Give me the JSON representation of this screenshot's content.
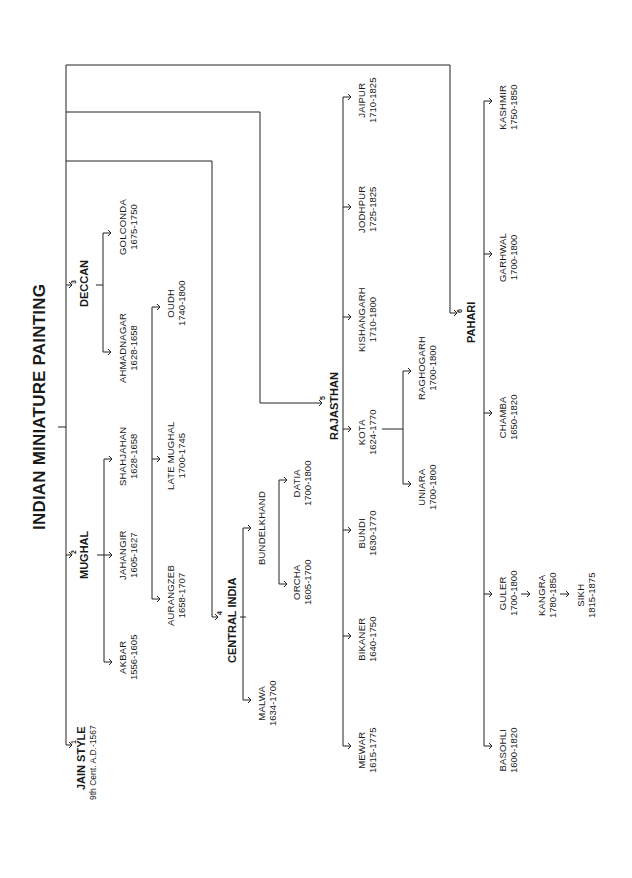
{
  "title": "INDIAN MINIATURE PAINTING",
  "orientation": "rotated 90deg counter-clockwise",
  "schools": [
    {
      "number": "1",
      "name": "JAIN STYLE",
      "dates": "9th Cent. A.D.-1567",
      "children": []
    },
    {
      "number": "2",
      "name": "MUGHAL",
      "children": [
        {
          "name": "AKBAR",
          "dates": "1556-1605"
        },
        {
          "name": "JAHANGIR",
          "dates": "1605-1627"
        },
        {
          "name": "SHAHJAHAN",
          "dates": "1628-1658"
        },
        {
          "name": "AURANGZEB",
          "dates": "1658-1707"
        },
        {
          "name": "LATE MUGHAL",
          "dates": "1700-1745"
        },
        {
          "name": "OUDH",
          "dates": "1740-1800"
        }
      ]
    },
    {
      "number": "3",
      "name": "DECCAN",
      "children": [
        {
          "name": "AHMADNAGAR",
          "dates": "1628-1658"
        },
        {
          "name": "GOLCONDA",
          "dates": "1675-1750"
        }
      ]
    },
    {
      "number": "4",
      "name": "CENTRAL INDIA",
      "children": [
        {
          "name": "MALWA",
          "dates": "1634-1700"
        },
        {
          "name": "BUNDELKHAND",
          "dates": "",
          "children": [
            {
              "name": "ORCHA",
              "dates": "1605-1700"
            },
            {
              "name": "DATIA",
              "dates": "1700-1800"
            }
          ]
        }
      ]
    },
    {
      "number": "5",
      "name": "RAJASTHAN",
      "children": [
        {
          "name": "MEWAR",
          "dates": "1615-1775"
        },
        {
          "name": "BIKANER",
          "dates": "1640-1750"
        },
        {
          "name": "BUNDI",
          "dates": "1630-1770"
        },
        {
          "name": "KOTA",
          "dates": "1624-1770",
          "children": [
            {
              "name": "UNIARA",
              "dates": "1700-1800"
            },
            {
              "name": "RAGHOGARH",
              "dates": "1700-1800"
            }
          ]
        },
        {
          "name": "KISHANGARH",
          "dates": "1710-1800"
        },
        {
          "name": "JODHPUR",
          "dates": "1725-1825"
        },
        {
          "name": "JAIPUR",
          "dates": "1710-1825"
        }
      ]
    },
    {
      "number": "6",
      "name": "PAHARI",
      "children": [
        {
          "name": "BASOHLI",
          "dates": "1600-1820"
        },
        {
          "name": "GULER",
          "dates": "1700-1800",
          "children": [
            {
              "name": "KANGRA",
              "dates": "1780-1850",
              "children": [
                {
                  "name": "SIKH",
                  "dates": "1815-1875"
                }
              ]
            }
          ]
        },
        {
          "name": "CHAMBA",
          "dates": "1650-1820"
        },
        {
          "name": "GARHWAL",
          "dates": "1700-1800"
        },
        {
          "name": "KASHMIR",
          "dates": "1750-1850"
        }
      ]
    }
  ]
}
